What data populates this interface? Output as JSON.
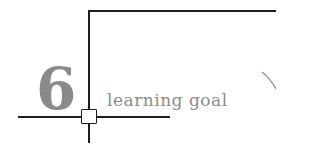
{
  "heading": {
    "number": "6",
    "label": "learning goal"
  },
  "colors": {
    "line": "#1e1e1e",
    "text": "#8a8a8a"
  }
}
